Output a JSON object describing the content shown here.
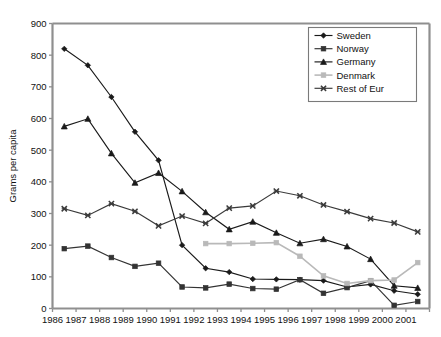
{
  "chart_data": {
    "type": "line",
    "title": "",
    "xlabel": "",
    "ylabel": "Grams per capita",
    "ylim": [
      0,
      900
    ],
    "ytick_step": 100,
    "yticks": [
      "0",
      "100",
      "200",
      "300",
      "400",
      "500",
      "600",
      "700",
      "800",
      "900"
    ],
    "grid": false,
    "legend_position": "top-right",
    "categories": [
      "1986",
      "1987",
      "1988",
      "1989",
      "1990",
      "1991",
      "1992",
      "1993",
      "1994",
      "1995",
      "1996",
      "1997",
      "1998",
      "1999",
      "2000",
      "2001"
    ],
    "x": [
      1986,
      1987,
      1988,
      1989,
      1990,
      1991,
      1992,
      1993,
      1994,
      1995,
      1996,
      1997,
      1998,
      1999,
      2000,
      2001
    ],
    "series": [
      {
        "name": "Sweden",
        "marker": "diamond",
        "color": "#1a1a1a",
        "values": [
          820,
          768,
          668,
          558,
          468,
          200,
          127,
          115,
          93,
          92,
          91,
          88,
          68,
          76,
          56,
          45
        ]
      },
      {
        "name": "Norway",
        "marker": "square",
        "color": "#333333",
        "values": [
          189,
          197,
          161,
          133,
          143,
          68,
          65,
          77,
          63,
          61,
          91,
          48,
          66,
          88,
          10,
          22
        ]
      },
      {
        "name": "Germany",
        "marker": "triangle",
        "color": "#1a1a1a",
        "values": [
          575,
          599,
          490,
          397,
          428,
          370,
          304,
          250,
          274,
          239,
          206,
          219,
          196,
          156,
          72,
          65
        ]
      },
      {
        "name": "Denmark",
        "marker": "square-light",
        "color": "#b9b9b9",
        "values": [
          null,
          null,
          null,
          null,
          null,
          null,
          205,
          205,
          206,
          208,
          165,
          103,
          79,
          88,
          90,
          145
        ]
      },
      {
        "name": "Rest of Eur",
        "marker": "cross",
        "color": "#3a3a3a",
        "values": [
          315,
          294,
          331,
          307,
          261,
          292,
          269,
          317,
          324,
          371,
          356,
          327,
          306,
          284,
          270,
          242
        ]
      }
    ]
  },
  "legend": {
    "items": [
      {
        "label": "Sweden"
      },
      {
        "label": "Norway"
      },
      {
        "label": "Germany"
      },
      {
        "label": "Denmark"
      },
      {
        "label": "Rest of Eur"
      }
    ]
  },
  "axes": {
    "y_title": "Grams per capita"
  }
}
